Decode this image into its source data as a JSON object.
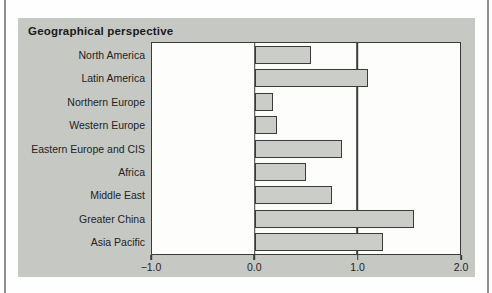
{
  "chart_data": {
    "type": "bar",
    "orientation": "horizontal",
    "title": "Geographical perspective",
    "categories": [
      "North America",
      "Latin America",
      "Northern Europe",
      "Western Europe",
      "Eastern Europe and CIS",
      "Africa",
      "Middle East",
      "Greater China",
      "Asia Pacific"
    ],
    "values": [
      0.55,
      1.1,
      0.18,
      0.22,
      0.85,
      0.5,
      0.75,
      1.55,
      1.25
    ],
    "xlabel": "",
    "ylabel": "",
    "xlim": [
      -1.0,
      2.0
    ],
    "x_ticks": [
      {
        "value": -1.0,
        "label": "−1.0"
      },
      {
        "value": 0.0,
        "label": "0.0"
      },
      {
        "value": 1.0,
        "label": "1.0"
      },
      {
        "value": 2.0,
        "label": "2.0"
      }
    ],
    "gridlines_at": [
      0.0,
      1.0
    ],
    "legend": "none",
    "colors": {
      "panel_bg": "#c6c8c4",
      "plot_bg": "#fdfdfc",
      "bar_fill": "#cbcdc9",
      "line": "#3b3b3b",
      "text": "#242424"
    }
  }
}
